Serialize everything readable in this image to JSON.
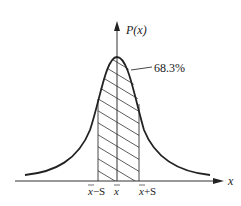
{
  "figure": {
    "y_axis_label": "P(x)",
    "x_axis_label": "x",
    "annotation": "68.3%",
    "ticks": [
      {
        "label": "x̄−S",
        "base": "x",
        "suffix": "−S"
      },
      {
        "label": "x̄",
        "base": "x",
        "suffix": ""
      },
      {
        "label": "x̄+S",
        "base": "x",
        "suffix": "+S"
      }
    ],
    "curve": "normal distribution",
    "shaded_region": "mean ± one standard deviation"
  },
  "colors": {
    "line": "#222222",
    "background": "#ffffff"
  }
}
